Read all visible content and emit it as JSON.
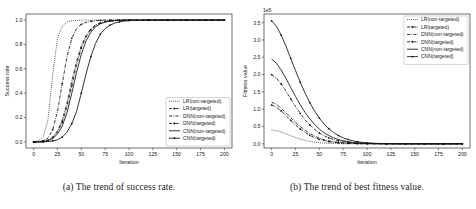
{
  "figure": {
    "background": "#ffffff",
    "line_color": "#111111"
  },
  "captions": {
    "a": "(a) The trend of success rate.",
    "b": "(b) The trend of best fitness value."
  },
  "chart_data": [
    {
      "type": "line",
      "panel": "a",
      "title": "",
      "xlabel": "Iteration",
      "ylabel": "Success rate",
      "xlim": [
        -8,
        208
      ],
      "ylim": [
        -0.05,
        1.05
      ],
      "xticks": [
        0,
        25,
        50,
        75,
        100,
        125,
        150,
        175,
        200
      ],
      "xticklabels": [
        "0",
        "25",
        "50",
        "75",
        "100",
        "125",
        "150",
        "175",
        "200"
      ],
      "yticks": [
        0.0,
        0.2,
        0.4,
        0.6,
        0.8,
        1.0
      ],
      "yticklabels": [
        "0.0",
        "0.2",
        "0.4",
        "0.6",
        "0.8",
        "1.0"
      ],
      "grid": false,
      "legend_position": "lower right",
      "exponent_label": "",
      "x": [
        0,
        5,
        10,
        15,
        20,
        25,
        30,
        35,
        40,
        45,
        50,
        55,
        60,
        65,
        70,
        75,
        80,
        85,
        90,
        95,
        100,
        110,
        120,
        130,
        140,
        150,
        160,
        170,
        180,
        190,
        200
      ],
      "series": [
        {
          "name": "LR(non-targeted)",
          "linestyle": "dotted",
          "marker": "none",
          "values": [
            0.0,
            0.01,
            0.04,
            0.18,
            0.55,
            0.85,
            0.95,
            0.985,
            0.995,
            0.998,
            1.0,
            1.0,
            1.0,
            1.0,
            1.0,
            1.0,
            1.0,
            1.0,
            1.0,
            1.0,
            1.0,
            1.0,
            1.0,
            1.0,
            1.0,
            1.0,
            1.0,
            1.0,
            1.0,
            1.0,
            1.0
          ]
        },
        {
          "name": "LR(targeted)",
          "linestyle": "dashdot",
          "marker": "star",
          "values": [
            0.0,
            0.0,
            0.01,
            0.03,
            0.1,
            0.25,
            0.48,
            0.7,
            0.85,
            0.93,
            0.965,
            0.982,
            0.99,
            0.995,
            0.998,
            1.0,
            1.0,
            1.0,
            1.0,
            1.0,
            1.0,
            1.0,
            1.0,
            1.0,
            1.0,
            1.0,
            1.0,
            1.0,
            1.0,
            1.0,
            1.0
          ]
        },
        {
          "name": "DNN(non-targeted)",
          "linestyle": "dashdot",
          "marker": "none",
          "values": [
            0.0,
            0.0,
            0.005,
            0.015,
            0.04,
            0.09,
            0.18,
            0.32,
            0.5,
            0.66,
            0.79,
            0.875,
            0.93,
            0.96,
            0.978,
            0.988,
            0.994,
            0.997,
            0.999,
            1.0,
            1.0,
            1.0,
            1.0,
            1.0,
            1.0,
            1.0,
            1.0,
            1.0,
            1.0,
            1.0,
            1.0
          ]
        },
        {
          "name": "DNN(targeted)",
          "linestyle": "dashdot",
          "marker": "star",
          "values": [
            0.0,
            0.0,
            0.004,
            0.012,
            0.035,
            0.08,
            0.16,
            0.29,
            0.46,
            0.63,
            0.77,
            0.86,
            0.92,
            0.955,
            0.975,
            0.986,
            0.993,
            0.996,
            0.998,
            1.0,
            1.0,
            1.0,
            1.0,
            1.0,
            1.0,
            1.0,
            1.0,
            1.0,
            1.0,
            1.0,
            1.0
          ]
        },
        {
          "name": "CNN(non-targeted)",
          "linestyle": "solid",
          "marker": "none",
          "values": [
            0.0,
            0.0,
            0.003,
            0.01,
            0.028,
            0.065,
            0.13,
            0.24,
            0.4,
            0.57,
            0.72,
            0.83,
            0.9,
            0.945,
            0.97,
            0.983,
            0.991,
            0.995,
            0.998,
            0.999,
            1.0,
            1.0,
            1.0,
            1.0,
            1.0,
            1.0,
            1.0,
            1.0,
            1.0,
            1.0,
            1.0
          ]
        },
        {
          "name": "CNN(targeted)",
          "linestyle": "solid",
          "marker": "star",
          "values": [
            0.0,
            0.0,
            0.0,
            0.003,
            0.008,
            0.018,
            0.04,
            0.08,
            0.15,
            0.25,
            0.4,
            0.56,
            0.7,
            0.81,
            0.885,
            0.93,
            0.958,
            0.975,
            0.986,
            0.992,
            0.996,
            0.999,
            1.0,
            1.0,
            1.0,
            1.0,
            1.0,
            1.0,
            1.0,
            1.0,
            1.0
          ]
        }
      ]
    },
    {
      "type": "line",
      "panel": "b",
      "title": "",
      "xlabel": "Iteration",
      "ylabel": "Fitness value",
      "xlim": [
        -8,
        208
      ],
      "ylim": [
        -0.12,
        3.75
      ],
      "xticks": [
        0,
        25,
        50,
        75,
        100,
        125,
        150,
        175,
        200
      ],
      "xticklabels": [
        "0",
        "25",
        "50",
        "75",
        "100",
        "125",
        "150",
        "175",
        "200"
      ],
      "yticks": [
        0.0,
        0.5,
        1.0,
        1.5,
        2.0,
        2.5,
        3.0,
        3.5
      ],
      "yticklabels": [
        "0.0",
        "0.5",
        "1.0",
        "1.5",
        "2.0",
        "2.5",
        "3.0",
        "3.5"
      ],
      "grid": false,
      "legend_position": "upper right",
      "exponent_label": "1e5",
      "x": [
        0,
        5,
        10,
        15,
        20,
        25,
        30,
        35,
        40,
        45,
        50,
        55,
        60,
        65,
        70,
        75,
        80,
        85,
        90,
        95,
        100,
        110,
        120,
        130,
        140,
        150,
        160,
        170,
        180,
        190,
        200
      ],
      "series": [
        {
          "name": "LR(non-targeted)",
          "linestyle": "dotted",
          "marker": "none",
          "values": [
            0.4,
            0.38,
            0.34,
            0.29,
            0.235,
            0.185,
            0.14,
            0.1,
            0.072,
            0.05,
            0.034,
            0.023,
            0.015,
            0.01,
            0.007,
            0.005,
            0.003,
            0.002,
            0.0015,
            0.001,
            0.0008,
            0.0005,
            0.0003,
            0.0002,
            0.0001,
            0.0001,
            0.0,
            0.0,
            0.0,
            0.0,
            0.0
          ]
        },
        {
          "name": "LR(targeted)",
          "linestyle": "dashdot",
          "marker": "star",
          "values": [
            1.12,
            1.06,
            0.95,
            0.82,
            0.68,
            0.55,
            0.43,
            0.33,
            0.245,
            0.18,
            0.13,
            0.092,
            0.064,
            0.044,
            0.03,
            0.02,
            0.014,
            0.009,
            0.006,
            0.004,
            0.003,
            0.0015,
            0.0008,
            0.0004,
            0.0002,
            0.0001,
            0.0,
            0.0,
            0.0,
            0.0,
            0.0
          ]
        },
        {
          "name": "DNN(non-targeted)",
          "linestyle": "dashdot",
          "marker": "none",
          "values": [
            1.2,
            1.14,
            1.03,
            0.9,
            0.76,
            0.62,
            0.5,
            0.39,
            0.3,
            0.225,
            0.165,
            0.12,
            0.086,
            0.061,
            0.043,
            0.03,
            0.02,
            0.014,
            0.009,
            0.006,
            0.004,
            0.002,
            0.001,
            0.0005,
            0.0003,
            0.0001,
            0.0,
            0.0,
            0.0,
            0.0,
            0.0
          ]
        },
        {
          "name": "DNN(targeted)",
          "linestyle": "dashdot",
          "marker": "star",
          "values": [
            2.0,
            1.9,
            1.73,
            1.52,
            1.3,
            1.08,
            0.88,
            0.7,
            0.545,
            0.42,
            0.315,
            0.235,
            0.172,
            0.124,
            0.088,
            0.062,
            0.043,
            0.03,
            0.02,
            0.014,
            0.009,
            0.004,
            0.002,
            0.001,
            0.0005,
            0.0002,
            0.0001,
            0.0,
            0.0,
            0.0,
            0.0
          ]
        },
        {
          "name": "CNN(non-targeted)",
          "linestyle": "solid",
          "marker": "none",
          "values": [
            2.45,
            2.33,
            2.13,
            1.89,
            1.63,
            1.37,
            1.13,
            0.91,
            0.72,
            0.56,
            0.425,
            0.32,
            0.238,
            0.174,
            0.125,
            0.089,
            0.063,
            0.044,
            0.03,
            0.021,
            0.014,
            0.006,
            0.003,
            0.0014,
            0.0006,
            0.0003,
            0.0001,
            0.0,
            0.0,
            0.0,
            0.0
          ]
        },
        {
          "name": "CNN(targeted)",
          "linestyle": "solid",
          "marker": "star",
          "values": [
            3.55,
            3.4,
            3.14,
            2.82,
            2.47,
            2.12,
            1.78,
            1.47,
            1.19,
            0.95,
            0.745,
            0.575,
            0.437,
            0.327,
            0.241,
            0.175,
            0.126,
            0.089,
            0.062,
            0.043,
            0.03,
            0.014,
            0.006,
            0.003,
            0.0012,
            0.0005,
            0.0002,
            0.0001,
            0.0,
            0.0,
            0.0
          ]
        }
      ]
    }
  ]
}
